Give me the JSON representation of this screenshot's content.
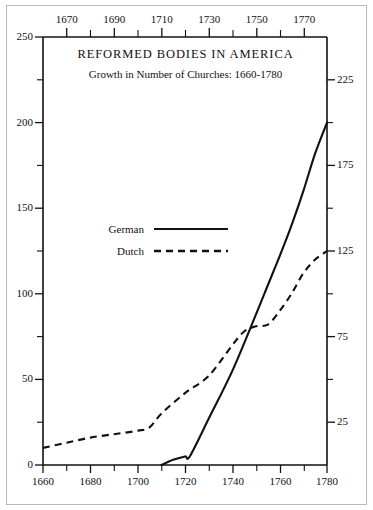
{
  "figure": {
    "title": "REFORMED BODIES IN AMERICA",
    "subtitle": "Growth in Number of Churches: 1660-1780"
  },
  "legend": {
    "items": [
      {
        "label": "German",
        "style": "solid"
      },
      {
        "label": "Dutch",
        "style": "dashed"
      }
    ]
  },
  "axes": {
    "top_ticks": [
      "1670",
      "1690",
      "1710",
      "1730",
      "1750",
      "1770"
    ],
    "bottom_ticks": [
      "1660",
      "1680",
      "1700",
      "1720",
      "1740",
      "1760",
      "1780"
    ],
    "left_ticks": [
      "250",
      "200",
      "150",
      "100",
      "50",
      "0"
    ],
    "right_ticks": [
      "225",
      "175",
      "125",
      "75",
      "25"
    ]
  },
  "chart_data": {
    "type": "line",
    "title": "REFORMED BODIES IN AMERICA",
    "subtitle": "Growth in Number of Churches: 1660-1780",
    "xlabel": "",
    "ylabel": "",
    "xlim": [
      1660,
      1780
    ],
    "ylim": [
      0,
      250
    ],
    "y_major_step": 50,
    "y_minor_step": 25,
    "x_major_step": 20,
    "x_minor_step": 10,
    "right_axis": {
      "ticks": [
        25,
        75,
        125,
        175,
        225
      ],
      "offset_from_left": 25
    },
    "grid": false,
    "legend_position": "center-left",
    "series": [
      {
        "name": "German",
        "style": "solid",
        "x": [
          1710,
          1715,
          1720,
          1722,
          1730,
          1740,
          1750,
          1755,
          1760,
          1765,
          1770,
          1775,
          1780
        ],
        "values": [
          0,
          3,
          5,
          5,
          27,
          55,
          88,
          105,
          122,
          140,
          160,
          182,
          200
        ]
      },
      {
        "name": "Dutch",
        "style": "dashed",
        "x": [
          1660,
          1670,
          1680,
          1690,
          1700,
          1705,
          1710,
          1720,
          1730,
          1740,
          1745,
          1750,
          1755,
          1760,
          1765,
          1770,
          1775,
          1780
        ],
        "values": [
          10,
          13,
          16,
          18,
          20,
          22,
          30,
          42,
          52,
          70,
          78,
          81,
          82,
          90,
          100,
          112,
          120,
          125
        ]
      }
    ],
    "crossing_point": {
      "x": 1737,
      "y": 80
    }
  }
}
